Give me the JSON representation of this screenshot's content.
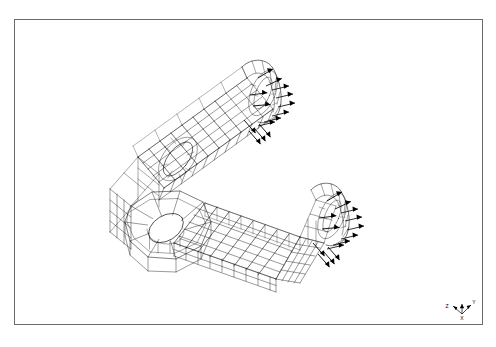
{
  "figure": {
    "kind": "fea-mesh-wireframe",
    "title": "",
    "background_color": "#ffffff",
    "line_color": "#000000",
    "frame": {
      "visible": true,
      "color": "#6a6a6a",
      "x": 14,
      "y": 19,
      "width": 469,
      "height": 306
    },
    "mesh": {
      "element_type": "hexahedral-shell-quad",
      "line_width": 0.45,
      "arm_grid_u": 22,
      "arm_grid_v": 6,
      "hole_sectors": 20
    },
    "loads": {
      "symbol": "arrow",
      "arrow_color": "#000000",
      "count_upper_arm": 14,
      "count_lower_arm": 14,
      "direction": "outward-right"
    },
    "features": [
      {
        "name": "upper-arm-hole",
        "shape": "ellipse"
      },
      {
        "name": "lower-pivot-hole",
        "shape": "ellipse"
      },
      {
        "name": "upper-arm-end-cap",
        "shape": "rounded"
      },
      {
        "name": "lower-arm-end-cap",
        "shape": "rounded"
      }
    ]
  },
  "triad": {
    "name": "coordinate-triad",
    "x_label": "X",
    "y_label": "Y",
    "z_label": "Z",
    "origin_x": 462,
    "origin_y": 314
  }
}
